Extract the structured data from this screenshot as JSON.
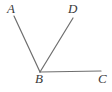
{
  "figure": {
    "kind": "angle-diagram",
    "background_color": "#ffffff",
    "stroke_color": "#6e6e6e",
    "label_color": "#3a3a3a",
    "stroke_width": 1.2,
    "width": 112,
    "height": 92
  },
  "labels": {
    "a": "A",
    "b": "B",
    "c": "C",
    "d": "D"
  },
  "points": {
    "A": {
      "x": 14,
      "y": 16
    },
    "B": {
      "x": 40,
      "y": 72
    },
    "C": {
      "x": 101,
      "y": 71
    },
    "D": {
      "x": 73,
      "y": 18
    }
  },
  "segments": [
    {
      "name": "ray-BA",
      "from": "B",
      "to": "A"
    },
    {
      "name": "ray-BD",
      "from": "B",
      "to": "D"
    },
    {
      "name": "ray-BC",
      "from": "B",
      "to": "C"
    }
  ]
}
